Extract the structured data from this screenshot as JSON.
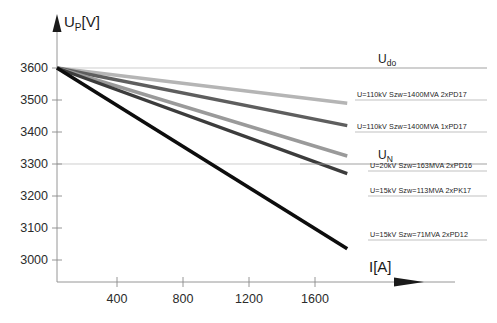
{
  "chart_data": {
    "type": "line",
    "title": "",
    "xlabel": "I[A]",
    "ylabel": "UP[V]",
    "ylabel_main": "U",
    "ylabel_sub": "P",
    "ylabel_unit": "[V]",
    "xlim": [
      0,
      1900
    ],
    "ylim": [
      2950,
      3650
    ],
    "grid": true,
    "legend_position": "right-inline",
    "y_ticks": [
      3600,
      3500,
      3400,
      3300,
      3200,
      3100,
      3000
    ],
    "y_tick_labels": [
      "3600",
      "3500",
      "3400",
      "3300",
      "3200",
      "3100",
      "3000"
    ],
    "x_ticks": [
      400,
      800,
      1200,
      1600
    ],
    "x_tick_labels": [
      "400",
      "800",
      "1200",
      "1600"
    ],
    "reference_lines": [
      {
        "name": "Udo",
        "label_main": "U",
        "label_sub": "do",
        "value": 3600,
        "color": "#b0b0b0"
      },
      {
        "name": "UN",
        "label_main": "U",
        "label_sub": "N",
        "value": 3300,
        "color": "#b0b0b0"
      }
    ],
    "series": [
      {
        "name": "U=110kV Szw=1400MVA 2xPD17",
        "label": "U=110kV Szw=1400MVA 2xPD17",
        "color": "#b5b5b5",
        "width": 3.4,
        "x": [
          0,
          1800
        ],
        "values": [
          3600,
          3490
        ]
      },
      {
        "name": "U=110kV Szw=1400MVA 1xPD17",
        "label": "U=110kV Szw=1400MVA 1xPD17",
        "color": "#5e5e5e",
        "width": 3.4,
        "x": [
          0,
          1800
        ],
        "values": [
          3600,
          3420
        ]
      },
      {
        "name": "U=20kV Szw=163MVA 2xPD16",
        "label": "U=20kV Szw=163MVA 2xPD16",
        "color": "#9a9a9a",
        "width": 3.4,
        "x": [
          0,
          1800
        ],
        "values": [
          3600,
          3325
        ]
      },
      {
        "name": "U=15kV Szw=113MVA 2xPK17",
        "label": "U=15kV Szw=113MVA 2xPK17",
        "color": "#3c3c3c",
        "width": 3.4,
        "x": [
          0,
          1800
        ],
        "values": [
          3600,
          3270
        ]
      },
      {
        "name": "U=15kV Szw=71MVA 2xPD12",
        "label": "U=15kV Szw=71MVA 2xPD12",
        "color": "#0d0d0d",
        "width": 3.6,
        "x": [
          0,
          1800
        ],
        "values": [
          3600,
          3035
        ]
      }
    ]
  },
  "axes": {
    "y_title_main": "U",
    "y_title_sub": "P",
    "y_title_unit": "[V]",
    "x_title": "I[A]"
  }
}
